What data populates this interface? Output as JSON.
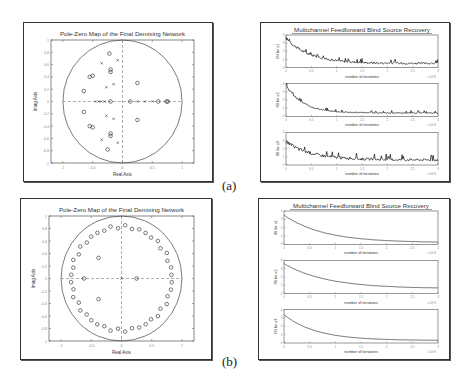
{
  "captions": {
    "a": "(a)",
    "b": "(b)"
  },
  "chart_data": [
    {
      "id": "a-left",
      "type": "scatter",
      "title": "Pole-Zero Map of the Final Demixing Network",
      "xlabel": "Real Axis",
      "ylabel": "Imag Axis",
      "xlim": [
        -1.2,
        1.2
      ],
      "ylim": [
        -1,
        1
      ],
      "xticks": [
        "-1",
        "-0.5",
        "0",
        "0.5",
        "1"
      ],
      "yticks": [
        "1",
        "0.8",
        "0.6",
        "0.4",
        "0.2",
        "0",
        "-0.2",
        "-0.4",
        "-0.6",
        "-0.8",
        "-1"
      ],
      "unit_circle": true,
      "grid": false,
      "series": [
        {
          "name": "zeros",
          "marker": "o",
          "points": [
            [
              -0.22,
              0.78
            ],
            [
              -0.2,
              0.52
            ],
            [
              -0.2,
              0.48
            ],
            [
              -0.55,
              0.4
            ],
            [
              -0.5,
              0.42
            ],
            [
              -0.65,
              0.17
            ],
            [
              -0.2,
              0
            ],
            [
              0.13,
              0
            ],
            [
              0.6,
              0
            ],
            [
              0.74,
              0
            ],
            [
              0.76,
              0
            ],
            [
              0.25,
              0.3
            ],
            [
              -0.65,
              -0.17
            ],
            [
              -0.55,
              -0.4
            ],
            [
              -0.5,
              -0.42
            ],
            [
              -0.2,
              -0.52
            ],
            [
              -0.2,
              -0.56
            ],
            [
              -0.25,
              -0.78
            ],
            [
              0.25,
              -0.3
            ]
          ]
        },
        {
          "name": "poles",
          "marker": "x",
          "points": [
            [
              -0.35,
              0.62
            ],
            [
              -0.08,
              0.67
            ],
            [
              -0.27,
              0.23
            ],
            [
              -0.15,
              0.28
            ],
            [
              -0.45,
              0
            ],
            [
              -0.4,
              0
            ],
            [
              -0.36,
              0
            ],
            [
              -0.3,
              0
            ],
            [
              0.25,
              0
            ],
            [
              0.38,
              0
            ],
            [
              0.5,
              0
            ],
            [
              -0.27,
              -0.23
            ],
            [
              -0.15,
              -0.28
            ],
            [
              -0.35,
              -0.62
            ],
            [
              -0.08,
              -0.67
            ]
          ]
        }
      ]
    },
    {
      "id": "a-right",
      "type": "line",
      "title": "Multichannel Feedforward Blind Source Recovery",
      "xlabel": "number of iterations",
      "x_multiplier": "x 10^4",
      "xlim": [
        0,
        3
      ],
      "xticks": [
        "0",
        "0.5",
        "1",
        "1.5",
        "2",
        "2.5",
        "3"
      ],
      "subplots": [
        {
          "ylabel": "ISI for s1",
          "ylim": [
            0,
            4
          ],
          "yticks": [
            "0",
            "1",
            "2",
            "3",
            "4"
          ],
          "start": 3.6,
          "end": 0.5,
          "decay": 2.2,
          "noise": 0.35
        },
        {
          "ylabel": "ISI for s2",
          "ylim": [
            0,
            4
          ],
          "yticks": [
            "0",
            "1",
            "2",
            "3",
            "4"
          ],
          "start": 3.8,
          "end": 0.4,
          "decay": 3.0,
          "noise": 0.2
        },
        {
          "ylabel": "ISI for s3",
          "ylim": [
            0,
            4
          ],
          "yticks": [
            "0",
            "1",
            "2",
            "3",
            "4"
          ],
          "start": 2.8,
          "end": 0.6,
          "decay": 2.0,
          "noise": 0.45
        }
      ]
    },
    {
      "id": "b-left",
      "type": "scatter",
      "title": "Pole-Zero Map of the Final Demixing Network",
      "xlabel": "Real Axis",
      "ylabel": "Imag Axis",
      "xlim": [
        -1.2,
        1.2
      ],
      "ylim": [
        -1,
        1
      ],
      "xticks": [
        "-1",
        "-0.5",
        "0",
        "0.5",
        "1"
      ],
      "yticks": [
        "1",
        "0.8",
        "0.6",
        "0.4",
        "0.2",
        "0",
        "-0.2",
        "-0.4",
        "-0.6",
        "-0.8",
        "-1"
      ],
      "unit_circle": true,
      "grid": false,
      "series": [
        {
          "name": "zeros",
          "marker": "o",
          "ring_radius": 0.83,
          "ring_count": 44,
          "extra_points": [
            [
              -0.62,
              0
            ],
            [
              0.25,
              0
            ],
            [
              -0.38,
              0.33
            ],
            [
              -0.38,
              -0.33
            ]
          ]
        },
        {
          "name": "poles",
          "marker": "x",
          "points": [
            [
              0,
              0
            ]
          ]
        }
      ]
    },
    {
      "id": "b-right",
      "type": "line",
      "title": "Multichannel Feedforward Blind Source Recovery",
      "xlabel": "number of iterations",
      "x_multiplier": "x 10^4",
      "xlim": [
        0,
        3
      ],
      "xticks": [
        "0",
        "0.5",
        "1",
        "1.5",
        "2",
        "2.5",
        "3"
      ],
      "subplots": [
        {
          "ylabel": "ISI for s1",
          "ylim": [
            0,
            4
          ],
          "yticks": [
            "0",
            "1",
            "2",
            "3",
            "4"
          ],
          "start": 3.5,
          "end": 0.2,
          "decay": 1.3,
          "noise": 0.05
        },
        {
          "ylabel": "ISI for s2",
          "ylim": [
            0,
            4
          ],
          "yticks": [
            "0",
            "1",
            "2",
            "3",
            "4"
          ],
          "start": 3.6,
          "end": 0.6,
          "decay": 1.2,
          "noise": 0.05
        },
        {
          "ylabel": "ISI for s3",
          "ylim": [
            0,
            4
          ],
          "yticks": [
            "0",
            "1",
            "2",
            "3",
            "4"
          ],
          "start": 3.4,
          "end": 0.3,
          "decay": 1.6,
          "noise": 0.04
        }
      ]
    }
  ]
}
